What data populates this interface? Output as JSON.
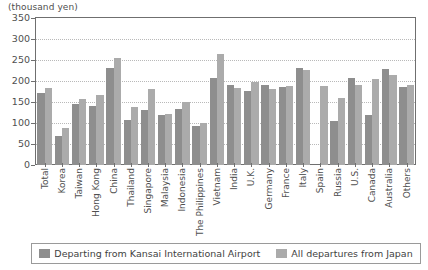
{
  "chart_data": {
    "type": "bar",
    "title": "",
    "subtitle": "",
    "unit_label": "(thousand yen)",
    "xlabel": "",
    "ylabel": "",
    "ylim": [
      0,
      350
    ],
    "yticks": [
      0,
      50,
      100,
      150,
      200,
      250,
      300,
      350
    ],
    "grid": true,
    "legend_position": "bottom",
    "categories": [
      "Total",
      "Korea",
      "Taiwan",
      "Hong Kong",
      "China",
      "Thailand",
      "Singapore",
      "Malaysia",
      "Indonesia",
      "The Philippines",
      "Vietnam",
      "India",
      "U.K.",
      "Germany",
      "France",
      "Italy",
      "Spain",
      "Russia",
      "U.S.",
      "Canada",
      "Australia",
      "Others"
    ],
    "series": [
      {
        "name": "Departing from Kansai International Airport",
        "color": "#8e8e8e",
        "values": [
          172,
          68,
          146,
          141,
          231,
          108,
          131,
          119,
          133,
          92,
          207,
          191,
          177,
          191,
          185,
          230,
          0,
          104,
          206,
          120,
          229,
          185
        ]
      },
      {
        "name": "All departures from Japan",
        "color": "#ababab",
        "values": [
          183,
          87,
          157,
          167,
          254,
          137,
          181,
          122,
          151,
          100,
          265,
          184,
          197,
          181,
          189,
          226,
          189,
          159,
          190,
          205,
          214,
          190
        ]
      }
    ]
  },
  "legend": {
    "items": [
      {
        "label": "Departing from Kansai International Airport",
        "swatch": "series-1-swatch"
      },
      {
        "label": "All departures from Japan",
        "swatch": "series-2-swatch"
      }
    ]
  }
}
